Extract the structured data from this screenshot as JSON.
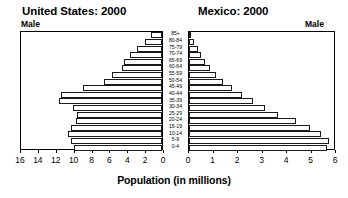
{
  "charts": {
    "us": {
      "title": "United States: 2000",
      "sex_label": "Male",
      "axis": {
        "min": 0,
        "max": 16,
        "ticks": [
          16,
          14,
          12,
          10,
          8,
          6,
          4,
          2,
          0
        ],
        "direction": "right-to-left"
      }
    },
    "mexico": {
      "title": "Mexico: 2000",
      "sex_label": "Male",
      "axis": {
        "min": 0,
        "max": 6,
        "ticks": [
          0,
          1,
          2,
          3,
          4,
          5,
          6
        ],
        "direction": "left-to-right"
      }
    }
  },
  "axis_caption": "Population (in millions)",
  "age_groups": [
    "85+",
    "80-84",
    "75-79",
    "70-74",
    "65-69",
    "60-64",
    "55-59",
    "50-54",
    "45-49",
    "40-44",
    "35-39",
    "30-34",
    "25-29",
    "20-24",
    "15-19",
    "10-14",
    "5-9",
    "0-4"
  ],
  "chart_data": [
    {
      "type": "bar",
      "orientation": "horizontal",
      "title": "United States: 2000",
      "subtitle": "Male",
      "xlabel": "Population (in millions)",
      "ylabel": "",
      "xlim": [
        0,
        16
      ],
      "xticks": [
        16,
        14,
        12,
        10,
        8,
        6,
        4,
        2,
        0
      ],
      "reversed_x": true,
      "grid": false,
      "legend": "none",
      "categories": [
        "85+",
        "80-84",
        "75-79",
        "70-74",
        "65-69",
        "60-64",
        "55-59",
        "50-54",
        "45-49",
        "40-44",
        "35-39",
        "30-34",
        "25-29",
        "20-24",
        "15-19",
        "10-14",
        "5-9",
        "0-4"
      ],
      "values": [
        1.2,
        1.9,
        2.8,
        3.6,
        4.2,
        4.5,
        5.6,
        6.5,
        8.8,
        11.3,
        11.5,
        10.0,
        9.5,
        9.6,
        10.2,
        10.5,
        10.2,
        9.8
      ],
      "units": "millions"
    },
    {
      "type": "bar",
      "orientation": "horizontal",
      "title": "Mexico: 2000",
      "subtitle": "Male",
      "xlabel": "Population (in millions)",
      "ylabel": "",
      "xlim": [
        0,
        6
      ],
      "xticks": [
        0,
        1,
        2,
        3,
        4,
        5,
        6
      ],
      "reversed_x": false,
      "grid": false,
      "legend": "none",
      "categories": [
        "85+",
        "80-84",
        "75-79",
        "70-74",
        "65-69",
        "60-64",
        "55-59",
        "50-54",
        "45-49",
        "40-44",
        "35-39",
        "30-34",
        "25-29",
        "20-24",
        "15-19",
        "10-14",
        "5-9",
        "0-4"
      ],
      "values": [
        0.1,
        0.22,
        0.35,
        0.5,
        0.65,
        0.85,
        1.1,
        1.4,
        1.75,
        2.15,
        2.6,
        3.1,
        3.65,
        4.35,
        4.95,
        5.4,
        5.7,
        5.65
      ],
      "units": "millions"
    }
  ]
}
